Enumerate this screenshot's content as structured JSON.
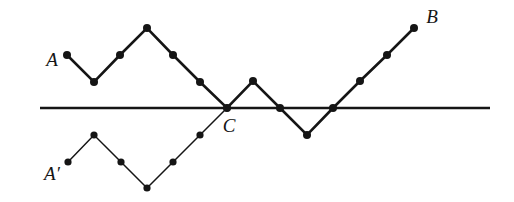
{
  "figure": {
    "background_color": "#ffffff",
    "stroke_color": "#151515",
    "width": 514,
    "height": 202
  },
  "axis": {
    "name": "horizontal-reflection-line",
    "x1": 40,
    "x2": 490,
    "y": 108,
    "stroke_width": 2.6,
    "color": "#151515"
  },
  "labels": [
    {
      "id": "A",
      "text": "A",
      "x": 52,
      "y": 62,
      "font_style": "italic"
    },
    {
      "id": "B",
      "text": "B",
      "x": 432,
      "y": 19,
      "font_style": "italic"
    },
    {
      "id": "C",
      "text": "C",
      "x": 229,
      "y": 128,
      "font_style": "italic"
    },
    {
      "id": "Ap",
      "text": "A′",
      "x": 52,
      "y": 176,
      "font_style": "italic"
    }
  ],
  "chart_data": {
    "type": "line",
    "title": "",
    "xlabel": "",
    "ylabel": "",
    "grid": false,
    "legend": "none",
    "step_x": 26.6,
    "step_y": 26.6,
    "baseline_y": 108,
    "series": [
      {
        "name": "path-A-to-B",
        "label": "A → B",
        "stroke_width": 2.6,
        "marker": "filled-circle",
        "marker_radius": 4.0,
        "points": [
          [
            67,
            55
          ],
          [
            94,
            82
          ],
          [
            120,
            55
          ],
          [
            147,
            28
          ],
          [
            173,
            55
          ],
          [
            200,
            82
          ],
          [
            227,
            108
          ],
          [
            253,
            81
          ],
          [
            280,
            108
          ],
          [
            307,
            135
          ],
          [
            333,
            108
          ],
          [
            360,
            81
          ],
          [
            387,
            55
          ],
          [
            414,
            28
          ]
        ],
        "steps": [
          -1,
          1,
          1,
          -1,
          -1,
          -1,
          1,
          -1,
          -1,
          1,
          1,
          1,
          1
        ]
      },
      {
        "name": "path-A-prime-to-C",
        "label": "A′ → C",
        "stroke_width": 1.5,
        "marker": "filled-circle",
        "marker_radius": 3.6,
        "points": [
          [
            68,
            162
          ],
          [
            94,
            135
          ],
          [
            121,
            162
          ],
          [
            147,
            188
          ],
          [
            173,
            162
          ],
          [
            200,
            135
          ],
          [
            227,
            108
          ]
        ],
        "steps": [
          1,
          -1,
          -1,
          1,
          1,
          1
        ]
      }
    ],
    "annotations": [
      {
        "text": "A",
        "point": [
          67,
          55
        ],
        "placement": "left"
      },
      {
        "text": "B",
        "point": [
          414,
          28
        ],
        "placement": "right"
      },
      {
        "text": "C",
        "point": [
          227,
          108
        ],
        "placement": "below-right"
      },
      {
        "text": "A′",
        "point": [
          68,
          162
        ],
        "placement": "left-below"
      }
    ]
  }
}
